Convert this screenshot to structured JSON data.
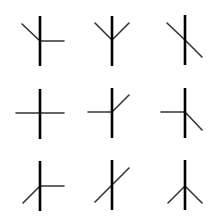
{
  "figure": {
    "colors": {
      "background": "#ffffff",
      "stem": "#000000",
      "branch": "#333333"
    },
    "grid": {
      "rows": 3,
      "cols": 3
    },
    "glyphs": [
      {
        "id": "r1c1",
        "center": [
          40,
          41
        ],
        "stem": [
          16,
          66
        ],
        "branches": [
          [
            64,
            41
          ],
          [
            22,
            24
          ]
        ]
      },
      {
        "id": "r1c2",
        "center": [
          112,
          40
        ],
        "stem": [
          16,
          66
        ],
        "branches": [
          [
            95,
            23
          ],
          [
            129,
            23
          ]
        ]
      },
      {
        "id": "r1c3",
        "center": [
          185,
          40
        ],
        "stem": [
          15,
          65
        ],
        "branches": [
          [
            167,
            23
          ],
          [
            202,
            57
          ]
        ]
      },
      {
        "id": "r2c1",
        "center": [
          40,
          113
        ],
        "stem": [
          89,
          139
        ],
        "branches": [
          [
            16,
            113
          ],
          [
            64,
            113
          ]
        ]
      },
      {
        "id": "r2c2",
        "center": [
          112,
          112
        ],
        "stem": [
          88,
          138
        ],
        "branches": [
          [
            88,
            112
          ],
          [
            129,
            95
          ]
        ]
      },
      {
        "id": "r2c3",
        "center": [
          185,
          112
        ],
        "stem": [
          88,
          138
        ],
        "branches": [
          [
            161,
            112
          ],
          [
            202,
            130
          ]
        ]
      },
      {
        "id": "r3c1",
        "center": [
          40,
          186
        ],
        "stem": [
          161,
          211
        ],
        "branches": [
          [
            64,
            186
          ],
          [
            23,
            203
          ]
        ]
      },
      {
        "id": "r3c2",
        "center": [
          112,
          185
        ],
        "stem": [
          160,
          210
        ],
        "branches": [
          [
            95,
            202
          ],
          [
            129,
            168
          ]
        ]
      },
      {
        "id": "r3c3",
        "center": [
          185,
          186
        ],
        "stem": [
          160,
          210
        ],
        "branches": [
          [
            168,
            203
          ],
          [
            202,
            203
          ]
        ]
      }
    ]
  }
}
